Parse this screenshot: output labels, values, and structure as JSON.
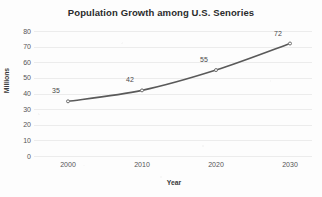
{
  "chart_data": {
    "type": "line",
    "title": "Population Growth among U.S. Senories",
    "xlabel": "Year",
    "ylabel": "Millions",
    "categories": [
      "2000",
      "2010",
      "2020",
      "2030"
    ],
    "values": [
      35,
      42,
      55,
      72
    ],
    "point_labels": [
      "35",
      "42",
      "55",
      "72"
    ],
    "ylim": [
      0,
      80
    ],
    "y_ticks": [
      "0",
      "10",
      "20",
      "30",
      "40",
      "50",
      "60",
      "70",
      "80"
    ],
    "grid": true,
    "legend": "none",
    "series": [
      {
        "name": "Population",
        "values": [
          35,
          42,
          55,
          72
        ]
      }
    ],
    "colors": {
      "line": "#5a5a5a",
      "marker": "#6e6e6e",
      "grid": "#ececec",
      "text": "#3a3a3a",
      "tick_text": "#555555",
      "title_text": "#2b2b2b",
      "background": "#fdfdfd"
    }
  }
}
